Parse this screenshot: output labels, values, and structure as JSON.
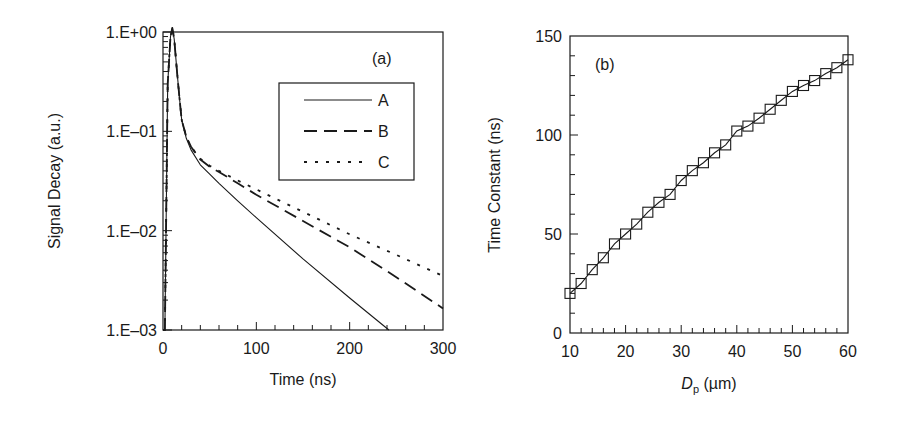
{
  "figure": {
    "ink_color": "#1a1a1a",
    "background": "#ffffff"
  },
  "chart_data": [
    {
      "id": "a",
      "type": "line",
      "panel_label": "(a)",
      "title": "",
      "xlabel": "Time (ns)",
      "ylabel": "Signal Decay (a.u.)",
      "xscale": "linear",
      "yscale": "log",
      "xlim": [
        0,
        300
      ],
      "ylim": [
        0.001,
        1
      ],
      "xticks": [
        0,
        100,
        200,
        300
      ],
      "xtick_labels": [
        "0",
        "100",
        "200",
        "300"
      ],
      "x_minor_step": 20,
      "yticks": [
        1,
        0.1,
        0.01,
        0.001
      ],
      "ytick_labels": [
        "1.E+00",
        "1.E–01",
        "1.E–02",
        "1.E–03"
      ],
      "grid": false,
      "legend": {
        "position": "upper right (inset box)",
        "entries": [
          "A",
          "B",
          "C"
        ]
      },
      "series": [
        {
          "name": "A",
          "style": "solid",
          "x": [
            0,
            2,
            5,
            8,
            10,
            12,
            15,
            18,
            20,
            25,
            30,
            40,
            50,
            60,
            80,
            100,
            150,
            200,
            242
          ],
          "y": [
            0.001,
            0.001,
            0.3,
            0.9,
            1.1,
            0.85,
            0.4,
            0.2,
            0.13,
            0.085,
            0.065,
            0.046,
            0.037,
            0.03,
            0.02,
            0.0135,
            0.0052,
            0.0021,
            0.001
          ]
        },
        {
          "name": "B",
          "style": "dashed",
          "x": [
            0,
            2,
            5,
            8,
            10,
            12,
            15,
            18,
            20,
            25,
            30,
            40,
            50,
            60,
            80,
            100,
            150,
            200,
            250,
            300
          ],
          "y": [
            0.001,
            0.001,
            0.3,
            0.9,
            1.1,
            0.85,
            0.4,
            0.2,
            0.13,
            0.088,
            0.07,
            0.052,
            0.044,
            0.039,
            0.03,
            0.023,
            0.0125,
            0.0068,
            0.0034,
            0.00165
          ]
        },
        {
          "name": "C",
          "style": "dotted",
          "x": [
            0,
            2,
            5,
            8,
            10,
            12,
            15,
            18,
            20,
            25,
            30,
            40,
            50,
            60,
            80,
            100,
            150,
            200,
            250,
            300
          ],
          "y": [
            0.001,
            0.001,
            0.3,
            0.9,
            1.1,
            0.85,
            0.4,
            0.2,
            0.13,
            0.088,
            0.07,
            0.053,
            0.045,
            0.04,
            0.032,
            0.026,
            0.0155,
            0.0092,
            0.0057,
            0.0035
          ]
        }
      ]
    },
    {
      "id": "b",
      "type": "line",
      "panel_label": "(b)",
      "title": "",
      "xlabel_main": "D",
      "xlabel_sub": "p",
      "xlabel_unit": " (µm)",
      "xlabel": "Dp (µm)",
      "ylabel": "Time Constant (ns)",
      "xscale": "linear",
      "yscale": "linear",
      "xlim": [
        10,
        60
      ],
      "ylim": [
        0,
        150
      ],
      "xticks": [
        10,
        20,
        30,
        40,
        50,
        60
      ],
      "xtick_labels": [
        "10",
        "20",
        "30",
        "40",
        "50",
        "60"
      ],
      "x_minor_step": 2,
      "yticks": [
        0,
        50,
        100,
        150
      ],
      "ytick_labels": [
        "0",
        "50",
        "100",
        "150"
      ],
      "y_minor_step": 10,
      "grid": false,
      "marker": "open-square",
      "series": [
        {
          "name": "Time constant",
          "style": "solid with square markers",
          "x": [
            10,
            12,
            14,
            16,
            18,
            20,
            22,
            24,
            26,
            28,
            30,
            32,
            34,
            36,
            38,
            40,
            42,
            44,
            46,
            48,
            50,
            52,
            54,
            56,
            58,
            60
          ],
          "y": [
            20,
            25,
            32,
            38,
            45,
            50,
            55,
            61,
            66,
            70,
            77,
            82,
            86,
            91,
            95,
            102,
            104.5,
            108.5,
            113,
            117.5,
            122,
            125,
            127.5,
            131,
            134,
            138
          ]
        }
      ]
    }
  ]
}
